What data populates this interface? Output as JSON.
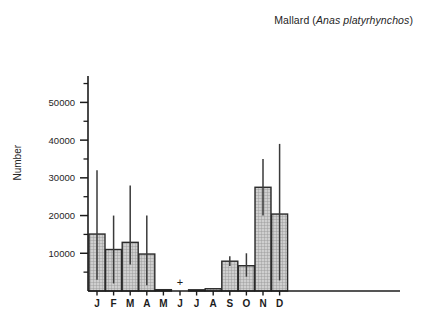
{
  "chart_data": {
    "type": "bar",
    "title": "Mallard (Anas platyrhynchos)",
    "title_common_name": "Mallard (",
    "title_scientific_name": "Anas platyrhynchos",
    "title_close": ")",
    "xlabel": "",
    "ylabel": "Number",
    "categories": [
      "J",
      "F",
      "M",
      "A",
      "M",
      "J",
      "J",
      "A",
      "S",
      "O",
      "N",
      "D"
    ],
    "month_names": [
      "January",
      "February",
      "March",
      "April",
      "May",
      "June",
      "July",
      "August",
      "September",
      "October",
      "November",
      "December"
    ],
    "values": [
      15100,
      11000,
      12900,
      9800,
      350,
      0,
      300,
      600,
      7900,
      6700,
      27500,
      20400
    ],
    "range_low": [
      3000,
      2000,
      7000,
      1500,
      null,
      null,
      null,
      null,
      6600,
      3800,
      20000,
      2800
    ],
    "range_high": [
      32000,
      20000,
      28000,
      20000,
      null,
      null,
      null,
      null,
      9200,
      10000,
      35000,
      39000
    ],
    "trace_marker": {
      "category": "J",
      "category_index": 5,
      "symbol": "+"
    },
    "ylim": [
      0,
      57000
    ],
    "ymajor_ticks": [
      10000,
      20000,
      30000,
      40000,
      50000
    ],
    "ymajor_tick_labels": [
      "10000",
      "20000",
      "30000",
      "40000",
      "50000"
    ],
    "yminor_ticks": [
      5000,
      15000,
      25000,
      35000,
      45000,
      55000
    ],
    "grid": false,
    "legend": false,
    "bar_fill_color": "#bdbdbd",
    "bar_edge_color": "#2b2b2b",
    "axis_color": "#1c1c1c",
    "whisker_color": "#3a3a3a",
    "background_color": "#ffffff"
  }
}
